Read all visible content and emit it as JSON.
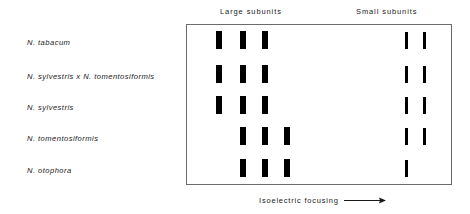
{
  "figure": {
    "headers": {
      "large": "Large subunits",
      "small": "Small subunits"
    },
    "axis_caption": "Isoelectric focusing",
    "axis_arrow_icon": "arrow-right-icon",
    "rows": [
      {
        "label": "N. tabacum"
      },
      {
        "label": "N. sylvestris x N. tomentosiformis"
      },
      {
        "label": "N. sylvestris"
      },
      {
        "label": "N. tomentosiformis"
      },
      {
        "label": "N. otophora"
      }
    ]
  },
  "chart_data": {
    "type": "table",
    "xlabel": "Isoelectric focusing",
    "ylabel": "",
    "grid": false,
    "legend": "none",
    "column_groups": [
      "Large subunits",
      "Small subunits"
    ],
    "categories": [
      "N. tabacum",
      "N. sylvestris x N. tomentosiformis",
      "N. sylvestris",
      "N. tomentosiformis",
      "N. otophora"
    ],
    "large_subunit_positions": [
      1,
      2,
      3,
      4
    ],
    "small_subunit_positions": [
      1,
      2
    ],
    "series": [
      {
        "name": "N. tabacum",
        "large_bands": [
          1,
          2,
          3
        ],
        "small_bands": [
          1,
          2
        ]
      },
      {
        "name": "N. sylvestris x N. tomentosiformis",
        "large_bands": [
          1,
          2,
          3
        ],
        "small_bands": [
          1,
          2
        ]
      },
      {
        "name": "N. sylvestris",
        "large_bands": [
          1,
          2,
          3
        ],
        "small_bands": [
          1,
          2
        ]
      },
      {
        "name": "N. tomentosiformis",
        "large_bands": [
          2,
          3,
          4
        ],
        "small_bands": [
          1,
          2
        ]
      },
      {
        "name": "N. otophora",
        "large_bands": [
          2,
          3,
          4
        ],
        "small_bands": [
          1
        ]
      }
    ],
    "layout": {
      "row_y": [
        30,
        64,
        95,
        126,
        158
      ],
      "large_x": [
        215,
        239,
        261,
        283
      ],
      "small_x": [
        404,
        422
      ],
      "label_y": [
        38,
        72,
        103,
        134,
        166
      ]
    }
  }
}
